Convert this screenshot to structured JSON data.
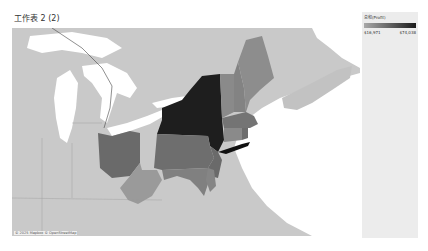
{
  "sheet": {
    "title": "工作表 2 (2)"
  },
  "map": {
    "attribution": "© 2025 Mapbox © OpenStreetMap",
    "fill_scale": {
      "min_color": "#a9a9a9",
      "max_color": "#1a1a1a",
      "land_color": "#c9c9c9",
      "water_color": "#ffffff"
    },
    "regions": [
      {
        "name": "New York",
        "shade": "darkest"
      },
      {
        "name": "Pennsylvania",
        "shade": "medium-dark"
      },
      {
        "name": "Ohio",
        "shade": "medium-dark"
      },
      {
        "name": "New Jersey",
        "shade": "medium-dark"
      },
      {
        "name": "Vermont",
        "shade": "medium"
      },
      {
        "name": "New Hampshire",
        "shade": "medium"
      },
      {
        "name": "Maine",
        "shade": "medium"
      },
      {
        "name": "Massachusetts",
        "shade": "medium-dark"
      },
      {
        "name": "Connecticut",
        "shade": "medium"
      },
      {
        "name": "Rhode Island",
        "shade": "medium-dark"
      },
      {
        "name": "West Virginia",
        "shade": "light"
      },
      {
        "name": "Maryland",
        "shade": "medium"
      },
      {
        "name": "Delaware",
        "shade": "medium"
      }
    ]
  },
  "legend": {
    "title": "总和(Profit)",
    "min_label": "$16,971",
    "max_label": "$74,038"
  }
}
